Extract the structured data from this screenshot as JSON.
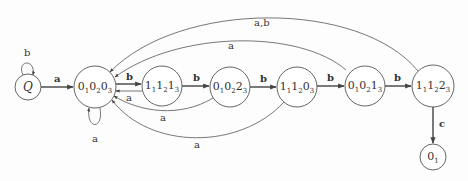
{
  "diagram": {
    "type": "state-machine",
    "nodes": [
      {
        "id": "Q",
        "label": "Q",
        "parts": [],
        "cx": 28,
        "cy": 87,
        "r": 13
      },
      {
        "id": "s000",
        "label": "0₁0₂0₃",
        "parts": [
          [
            "0",
            "1"
          ],
          [
            "0",
            "2"
          ],
          [
            "0",
            "3"
          ]
        ],
        "cx": 95,
        "cy": 87,
        "r": 21
      },
      {
        "id": "s111",
        "label": "1₁1₂1₃",
        "parts": [
          [
            "1",
            "1"
          ],
          [
            "1",
            "2"
          ],
          [
            "1",
            "3"
          ]
        ],
        "cx": 162,
        "cy": 86,
        "r": 20
      },
      {
        "id": "s002",
        "label": "0₁0₂2₃",
        "parts": [
          [
            "0",
            "1"
          ],
          [
            "0",
            "2"
          ],
          [
            "2",
            "3"
          ]
        ],
        "cx": 230,
        "cy": 87,
        "r": 20
      },
      {
        "id": "s110",
        "label": "1₁1₂0₃",
        "parts": [
          [
            "1",
            "1"
          ],
          [
            "1",
            "2"
          ],
          [
            "0",
            "3"
          ]
        ],
        "cx": 297,
        "cy": 87,
        "r": 20
      },
      {
        "id": "s001",
        "label": "0₁0₂1₃",
        "parts": [
          [
            "0",
            "1"
          ],
          [
            "0",
            "2"
          ],
          [
            "1",
            "3"
          ]
        ],
        "cx": 365,
        "cy": 86,
        "r": 20
      },
      {
        "id": "s112",
        "label": "1₁1₂2₃",
        "parts": [
          [
            "1",
            "1"
          ],
          [
            "1",
            "2"
          ],
          [
            "2",
            "3"
          ]
        ],
        "cx": 433,
        "cy": 86,
        "r": 21
      },
      {
        "id": "s0",
        "label": "0₁",
        "parts": [
          [
            "0",
            "1"
          ]
        ],
        "cx": 433,
        "cy": 157,
        "r": 13
      }
    ],
    "edges": [
      {
        "from": "Q",
        "to": "Q",
        "label": "b",
        "kind": "self-loop-top"
      },
      {
        "from": "Q",
        "to": "s000",
        "label": "a"
      },
      {
        "from": "s000",
        "to": "s000",
        "label": "a",
        "kind": "self-loop-bottom"
      },
      {
        "from": "s000",
        "to": "s111",
        "label": "b"
      },
      {
        "from": "s111",
        "to": "s000",
        "label": "a"
      },
      {
        "from": "s111",
        "to": "s002",
        "label": "b"
      },
      {
        "from": "s002",
        "to": "s000",
        "label": "a"
      },
      {
        "from": "s002",
        "to": "s110",
        "label": "b"
      },
      {
        "from": "s110",
        "to": "s000",
        "label": "a"
      },
      {
        "from": "s110",
        "to": "s001",
        "label": "b"
      },
      {
        "from": "s001",
        "to": "s000",
        "label": "a"
      },
      {
        "from": "s001",
        "to": "s112",
        "label": "b"
      },
      {
        "from": "s112",
        "to": "s000",
        "label": "a,b"
      },
      {
        "from": "s112",
        "to": "s0",
        "label": "c"
      }
    ],
    "edge_labels": {
      "q_loop": "b",
      "q_to_s000": "a",
      "s000_loop": "a",
      "s000_to_s111": "b",
      "s111_to_s000": "a",
      "s111_to_s002": "b",
      "s002_to_s000": "a",
      "s002_to_s110": "b",
      "s110_to_s000": "a",
      "s110_to_s001": "b",
      "s001_to_s000": "a",
      "s001_to_s112": "b",
      "s112_to_s000": "a,b",
      "s112_to_s0": "c"
    },
    "colors": {
      "stroke": "#555555",
      "text": "#333333",
      "background": "#fdfdfd"
    }
  }
}
